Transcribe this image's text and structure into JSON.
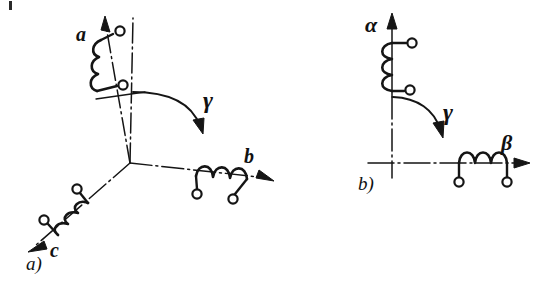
{
  "figure": {
    "background_color": "#ffffff",
    "ink_color": "#151515",
    "width": 536,
    "height": 297
  },
  "panels": [
    {
      "id": "panel-a",
      "caption": "a)",
      "caption_pos": [
        28,
        262
      ],
      "type": "three-phase-abc",
      "origin": [
        130,
        163
      ],
      "axes": [
        {
          "name": "a",
          "label": "a",
          "label_pos": [
            79,
            26
          ],
          "angle_deg": 100,
          "arrow_tip": [
            105,
            17
          ],
          "winding_turns": 3,
          "terminals": 2
        },
        {
          "name": "b",
          "label": "b",
          "label_pos": [
            246,
            155
          ],
          "angle_deg": -13,
          "arrow_tip": [
            272,
            180
          ],
          "winding_turns": 3,
          "terminals": 2
        },
        {
          "name": "c",
          "label": "c",
          "label_pos": [
            52,
            248
          ],
          "angle_deg": 221,
          "arrow_tip": [
            29,
            250
          ],
          "winding_turns": 3,
          "terminals": 2
        }
      ],
      "reference_line": {
        "name": "vertical-reference",
        "from": [
          133,
          18
        ],
        "to": [
          130,
          163
        ]
      },
      "rotation": {
        "label": "γ",
        "label_pos": [
          205,
          97
        ],
        "arc_from": [
          135,
          92
        ],
        "arc_to": [
          200,
          128
        ],
        "direction": "clockwise"
      }
    },
    {
      "id": "panel-b",
      "caption": "b)",
      "caption_pos": [
        360,
        181
      ],
      "type": "two-phase-alpha-beta",
      "origin": [
        380,
        163
      ],
      "axes": [
        {
          "name": "alpha",
          "label": "α",
          "label_pos": [
            368,
            16
          ],
          "angle_deg": 90,
          "arrow_tip": [
            392,
            14
          ],
          "winding_turns": 3,
          "terminals": 2
        },
        {
          "name": "beta",
          "label": "β",
          "label_pos": [
            503,
            136
          ],
          "angle_deg": 0,
          "arrow_tip": [
            528,
            163
          ],
          "winding_turns": 3,
          "terminals": 2
        }
      ],
      "rotation": {
        "label": "γ",
        "label_pos": [
          445,
          108
        ],
        "arc_from": [
          393,
          97
        ],
        "arc_to": [
          440,
          131
        ],
        "direction": "clockwise"
      }
    }
  ],
  "marks": {
    "corner_artifact": "top-left-speck"
  }
}
